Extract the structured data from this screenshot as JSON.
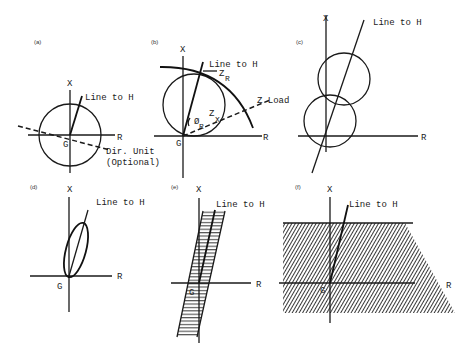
{
  "panels": {
    "a": {
      "tag": "(a)",
      "x_label": "X",
      "r_label": "R",
      "g_label": "G",
      "line_label": "Line to H",
      "dir_label_1": "Dir. Unit",
      "dir_label_2": "(Optional)"
    },
    "b": {
      "tag": "(b)",
      "x_label": "X",
      "r_label": "R",
      "g_label": "G",
      "line_label": "Line to H",
      "zr_label": "Z",
      "zr_sub": "R",
      "zload_label": "Z Load",
      "zx_label": "Z",
      "zx_sub": "X",
      "phi_label": "Ø",
      "phi_sub": "R"
    },
    "c": {
      "tag": "(c)",
      "x_label": "X",
      "r_label": "R",
      "line_label": "Line to H"
    },
    "d": {
      "tag": "(d)",
      "x_label": "X",
      "r_label": "R",
      "g_label": "G",
      "line_label": "Line to H"
    },
    "e": {
      "tag": "(e)",
      "x_label": "X",
      "r_label": "R",
      "g_label": "G",
      "line_label": "Line to H"
    },
    "f": {
      "tag": "(f)",
      "x_label": "X",
      "r_label": "R",
      "g_label": "G",
      "line_label": "Line to H"
    }
  }
}
